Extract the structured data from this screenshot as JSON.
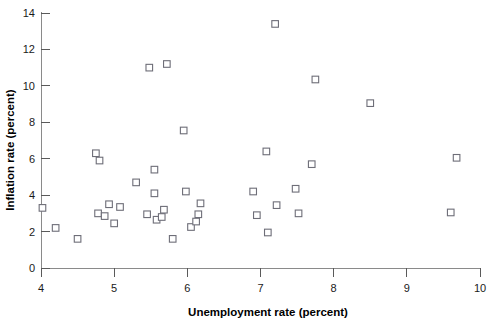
{
  "chart_data": {
    "type": "scatter",
    "title": "",
    "xlabel": "Unemployment rate (percent)",
    "ylabel": "Inflation rate (percent)",
    "xlim": [
      4,
      10
    ],
    "ylim": [
      0,
      14
    ],
    "xticks": [
      4,
      5,
      6,
      7,
      8,
      9,
      10
    ],
    "xtick_labels": [
      "4",
      "5",
      "6",
      "7",
      "8",
      "9",
      "10"
    ],
    "yticks": [
      0,
      2,
      4,
      6,
      8,
      10,
      12,
      14
    ],
    "ytick_labels": [
      "0",
      "2",
      "4",
      "6",
      "8",
      "10",
      "12",
      "14"
    ],
    "grid": false,
    "legend": null,
    "marker": "open-square",
    "marker_color": "#6e6e78",
    "points": [
      {
        "x": 4.02,
        "y": 3.3
      },
      {
        "x": 4.2,
        "y": 2.2
      },
      {
        "x": 4.5,
        "y": 1.6
      },
      {
        "x": 4.75,
        "y": 6.3
      },
      {
        "x": 4.8,
        "y": 5.9
      },
      {
        "x": 4.78,
        "y": 3.0
      },
      {
        "x": 4.87,
        "y": 2.85
      },
      {
        "x": 4.93,
        "y": 3.5
      },
      {
        "x": 5.0,
        "y": 2.45
      },
      {
        "x": 5.08,
        "y": 3.35
      },
      {
        "x": 5.3,
        "y": 4.7
      },
      {
        "x": 5.48,
        "y": 11.0
      },
      {
        "x": 5.55,
        "y": 5.4
      },
      {
        "x": 5.45,
        "y": 2.95
      },
      {
        "x": 5.55,
        "y": 4.1
      },
      {
        "x": 5.58,
        "y": 2.65
      },
      {
        "x": 5.65,
        "y": 2.8
      },
      {
        "x": 5.68,
        "y": 3.2
      },
      {
        "x": 5.72,
        "y": 11.2
      },
      {
        "x": 5.8,
        "y": 1.6
      },
      {
        "x": 5.95,
        "y": 7.55
      },
      {
        "x": 5.98,
        "y": 4.2
      },
      {
        "x": 6.05,
        "y": 2.25
      },
      {
        "x": 6.12,
        "y": 2.55
      },
      {
        "x": 6.18,
        "y": 3.55
      },
      {
        "x": 6.15,
        "y": 2.95
      },
      {
        "x": 6.9,
        "y": 4.2
      },
      {
        "x": 6.95,
        "y": 2.9
      },
      {
        "x": 7.08,
        "y": 6.4
      },
      {
        "x": 7.1,
        "y": 1.95
      },
      {
        "x": 7.2,
        "y": 13.4
      },
      {
        "x": 7.22,
        "y": 3.45
      },
      {
        "x": 7.48,
        "y": 4.35
      },
      {
        "x": 7.52,
        "y": 3.0
      },
      {
        "x": 7.7,
        "y": 5.7
      },
      {
        "x": 7.75,
        "y": 10.35
      },
      {
        "x": 8.5,
        "y": 9.05
      },
      {
        "x": 9.6,
        "y": 3.05
      },
      {
        "x": 9.68,
        "y": 6.05
      }
    ]
  }
}
